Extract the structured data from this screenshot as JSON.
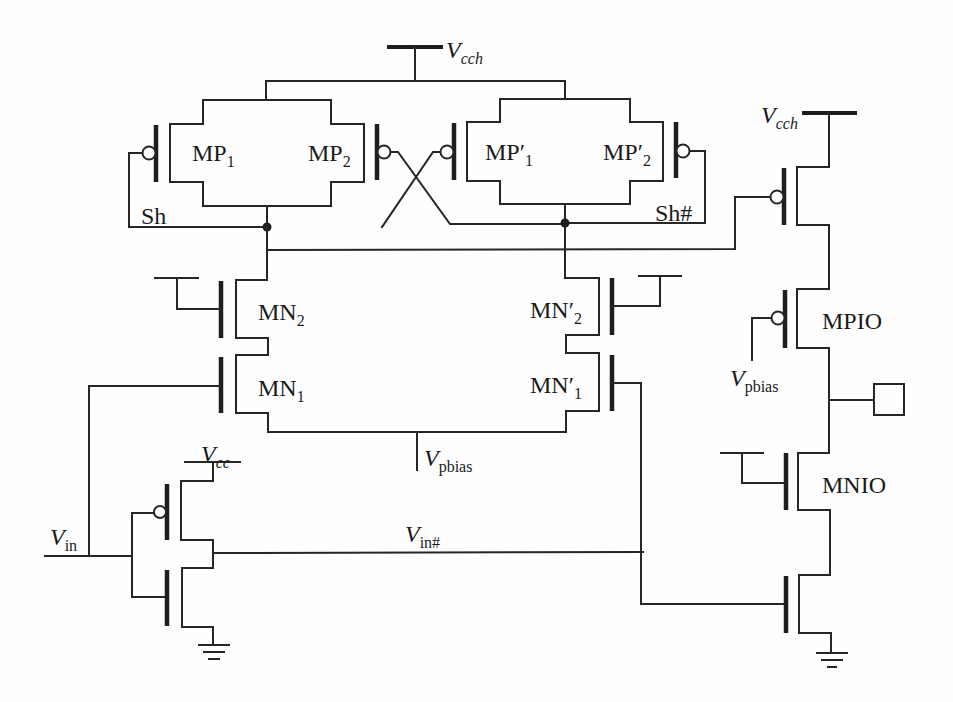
{
  "diagram": {
    "type": "circuit-schematic",
    "colors": {
      "wire": "#262626",
      "background": "#fefefe"
    },
    "labels": {
      "vcch_top": {
        "main": "V",
        "sub": "cch"
      },
      "vcch_right": {
        "main": "V",
        "sub": "cch"
      },
      "mp1": {
        "main": "MP",
        "sub": "1"
      },
      "mp2": {
        "main": "MP",
        "sub": "2"
      },
      "mp1p": {
        "main": "MP′",
        "sub": "1"
      },
      "mp2p": {
        "main": "MP′",
        "sub": "2"
      },
      "sh": "Sh",
      "sh_bar": "Sh#",
      "mn2": {
        "main": "MN",
        "sub": "2"
      },
      "mn1": {
        "main": "MN",
        "sub": "1"
      },
      "mn2p": {
        "main": "MN′",
        "sub": "2"
      },
      "mn1p": {
        "main": "MN′",
        "sub": "1"
      },
      "vpbias_center": {
        "main": "V",
        "sub": "pbias"
      },
      "vpbias_right": {
        "main": "V",
        "sub": "pbias"
      },
      "mpio": "MPIO",
      "mnio": "MNIO",
      "vcc": {
        "main": "V",
        "sub": "cc"
      },
      "vin": {
        "main": "V",
        "sub": "in"
      },
      "vin_bar": {
        "main": "V",
        "sub": "in#"
      }
    },
    "components": [
      {
        "id": "MP1",
        "kind": "pmos"
      },
      {
        "id": "MP2",
        "kind": "pmos"
      },
      {
        "id": "MP'1",
        "kind": "pmos"
      },
      {
        "id": "MP'2",
        "kind": "pmos"
      },
      {
        "id": "MN2",
        "kind": "nmos"
      },
      {
        "id": "MN1",
        "kind": "nmos"
      },
      {
        "id": "MN'2",
        "kind": "nmos"
      },
      {
        "id": "MN'1",
        "kind": "nmos"
      },
      {
        "id": "MPIO",
        "kind": "pmos"
      },
      {
        "id": "MNIO",
        "kind": "nmos"
      },
      {
        "id": "output-pull-up",
        "kind": "pmos"
      },
      {
        "id": "output-pull-down",
        "kind": "nmos"
      },
      {
        "id": "inverter-pmos",
        "kind": "pmos"
      },
      {
        "id": "inverter-nmos",
        "kind": "nmos"
      },
      {
        "id": "pad",
        "kind": "io-pad"
      }
    ]
  }
}
